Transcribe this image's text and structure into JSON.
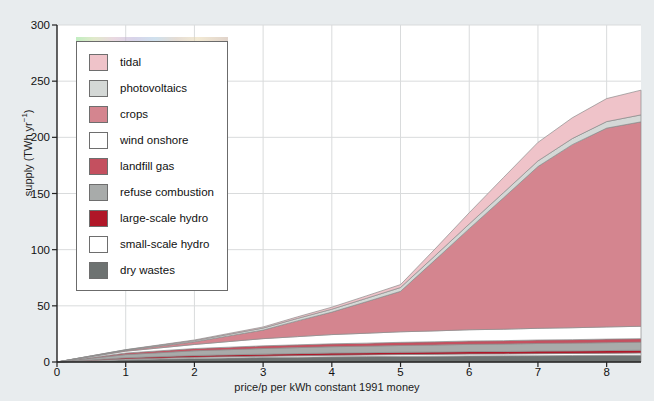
{
  "axes": {
    "ylabel": "supply (TWh yr−1)",
    "xlabel": "price/p per kWh constant 1991 money",
    "yticks": [
      "0",
      "50",
      "100",
      "150",
      "200",
      "250",
      "300"
    ],
    "xticks": [
      "0",
      "1",
      "2",
      "3",
      "4",
      "5",
      "6",
      "7",
      "8"
    ]
  },
  "legend": {
    "items": [
      {
        "label": "tidal",
        "color": "#efc3c9"
      },
      {
        "label": "photovoltaics",
        "color": "#d4d8d6"
      },
      {
        "label": "crops",
        "color": "#d4858f"
      },
      {
        "label": "wind onshore",
        "color": "#ffffff"
      },
      {
        "label": "landfill gas",
        "color": "#c4505f"
      },
      {
        "label": "refuse combustion",
        "color": "#a8abaa"
      },
      {
        "label": "large-scale hydro",
        "color": "#b01728"
      },
      {
        "label": "small-scale hydro",
        "color": "#ffffff"
      },
      {
        "label": "dry wastes",
        "color": "#6d7271"
      }
    ]
  },
  "chart_data": {
    "type": "area",
    "title": "",
    "xlabel": "price/p per kWh constant 1991 money",
    "ylabel": "supply (TWh yr-1)",
    "xlim": [
      0,
      8.5
    ],
    "ylim": [
      0,
      300
    ],
    "grid": true,
    "legend_position": "upper-left",
    "stacking": "stacked",
    "x": [
      0,
      0.5,
      1,
      1.5,
      2,
      2.5,
      3,
      3.5,
      4,
      4.5,
      5,
      5.5,
      6,
      6.5,
      7,
      7.5,
      8,
      8.5
    ],
    "series": [
      {
        "name": "dry wastes",
        "color": "#6d7271",
        "values": [
          0,
          1.0,
          2.0,
          2.6,
          3.2,
          3.6,
          4.0,
          4.3,
          4.6,
          4.8,
          5.0,
          5.2,
          5.4,
          5.5,
          5.6,
          5.8,
          5.9,
          6.0
        ]
      },
      {
        "name": "small-scale hydro",
        "color": "#ffffff",
        "values": [
          0,
          0.3,
          0.6,
          0.8,
          1.0,
          1.1,
          1.2,
          1.3,
          1.4,
          1.5,
          1.6,
          1.6,
          1.7,
          1.7,
          1.8,
          1.8,
          1.9,
          2.0
        ]
      },
      {
        "name": "large-scale hydro",
        "color": "#b01728",
        "values": [
          0,
          0.6,
          1.2,
          1.4,
          1.6,
          1.7,
          1.8,
          1.9,
          2.0,
          2.0,
          2.1,
          2.1,
          2.2,
          2.2,
          2.3,
          2.3,
          2.4,
          2.5
        ]
      },
      {
        "name": "refuse combustion",
        "color": "#a8abaa",
        "values": [
          0,
          1.4,
          2.8,
          3.5,
          4.2,
          4.6,
          5.0,
          5.3,
          5.6,
          5.8,
          6.0,
          6.2,
          6.4,
          6.6,
          6.8,
          6.9,
          7.0,
          7.1
        ]
      },
      {
        "name": "landfill gas",
        "color": "#c4505f",
        "values": [
          0,
          0.7,
          1.4,
          1.7,
          2.0,
          2.2,
          2.4,
          2.5,
          2.6,
          2.7,
          2.8,
          2.9,
          3.0,
          3.0,
          3.1,
          3.1,
          3.2,
          3.2
        ]
      },
      {
        "name": "wind onshore",
        "color": "#ffffff",
        "values": [
          0,
          0.8,
          1.6,
          2.6,
          3.6,
          5.0,
          6.4,
          7.3,
          8.2,
          8.8,
          9.4,
          9.7,
          10.0,
          10.2,
          10.4,
          10.6,
          10.8,
          11.0
        ]
      },
      {
        "name": "crops",
        "color": "#d4858f",
        "values": [
          0,
          0.4,
          0.8,
          1.6,
          2.4,
          5.0,
          7.6,
          14.0,
          20.0,
          28.0,
          36.0,
          63.0,
          90.0,
          117.0,
          144.0,
          163.0,
          177.0,
          182.0
        ]
      },
      {
        "name": "photovoltaics",
        "color": "#d4d8d6",
        "values": [
          0,
          0.2,
          0.4,
          0.7,
          1.0,
          1.4,
          1.8,
          2.2,
          2.6,
          3.0,
          3.4,
          3.8,
          4.2,
          4.6,
          5.0,
          5.4,
          5.8,
          6.2
        ]
      },
      {
        "name": "tidal",
        "color": "#efc3c9",
        "values": [
          0,
          0.1,
          0.2,
          0.4,
          0.6,
          0.8,
          1.0,
          1.4,
          1.8,
          2.2,
          2.6,
          6.0,
          10.0,
          13.5,
          16.5,
          18.5,
          20.5,
          22.0
        ]
      }
    ],
    "totals_note": "stacked total rises to about 256 TWh/yr at 8.5 p/kWh"
  }
}
